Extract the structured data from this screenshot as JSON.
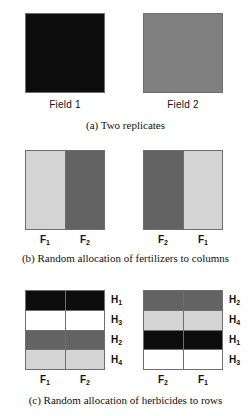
{
  "figure": {
    "background_color": "#ffffff"
  },
  "palette": {
    "black": "#0d0d0d",
    "dark_gray": "#636363",
    "medium_gray": "#808080",
    "light_gray": "#d4d4d4",
    "white": "#ffffff",
    "border": "#6e6e6e"
  },
  "panels": [
    {
      "id": "a",
      "caption": "(a)  Two replicates",
      "plots": [
        {
          "name": "Field 1",
          "label": "Field 1",
          "fill": "#0d0d0d",
          "cells": [
            {
              "treatment": "Field 1",
              "shade": "black",
              "color": "#0d0d0d"
            }
          ]
        },
        {
          "name": "Field 2",
          "label": "Field 2",
          "fill": "#808080",
          "cells": [
            {
              "treatment": "Field 2",
              "shade": "medium_gray",
              "color": "#808080"
            }
          ]
        }
      ]
    },
    {
      "id": "b",
      "caption": "(b)  Random allocation of fertilizers to columns",
      "plots": [
        {
          "name": "Field 1 fertilizer strips",
          "columns": [
            {
              "label": "F",
              "sub": "1",
              "color": "#d4d4d4",
              "shade": "light_gray"
            },
            {
              "label": "F",
              "sub": "2",
              "color": "#636363",
              "shade": "dark_gray"
            }
          ]
        },
        {
          "name": "Field 2 fertilizer strips",
          "columns": [
            {
              "label": "F",
              "sub": "2",
              "color": "#636363",
              "shade": "dark_gray"
            },
            {
              "label": "F",
              "sub": "1",
              "color": "#d4d4d4",
              "shade": "light_gray"
            }
          ]
        }
      ]
    },
    {
      "id": "c",
      "caption": "(c)  Random allocation of herbicides to rows",
      "plots": [
        {
          "name": "Field 1 herbicide rows",
          "column_labels": [
            {
              "label": "F",
              "sub": "1"
            },
            {
              "label": "F",
              "sub": "2"
            }
          ],
          "rows": [
            {
              "label": "H",
              "sub": "1",
              "color": "#0d0d0d",
              "shade": "black"
            },
            {
              "label": "H",
              "sub": "3",
              "color": "#ffffff",
              "shade": "white"
            },
            {
              "label": "H",
              "sub": "2",
              "color": "#636363",
              "shade": "dark_gray"
            },
            {
              "label": "H",
              "sub": "4",
              "color": "#d4d4d4",
              "shade": "light_gray"
            }
          ]
        },
        {
          "name": "Field 2 herbicide rows",
          "column_labels": [
            {
              "label": "F",
              "sub": "2"
            },
            {
              "label": "F",
              "sub": "1"
            }
          ],
          "rows": [
            {
              "label": "H",
              "sub": "2",
              "color": "#636363",
              "shade": "dark_gray"
            },
            {
              "label": "H",
              "sub": "4",
              "color": "#d4d4d4",
              "shade": "light_gray"
            },
            {
              "label": "H",
              "sub": "1",
              "color": "#0d0d0d",
              "shade": "black"
            },
            {
              "label": "H",
              "sub": "3",
              "color": "#ffffff",
              "shade": "white"
            }
          ]
        }
      ]
    }
  ]
}
